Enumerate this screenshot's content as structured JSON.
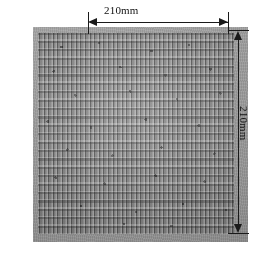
{
  "figure": {
    "kind": "micrograph",
    "background_color": "#ffffff",
    "photo": {
      "base_color": "#9b9b9b",
      "block_color": "#878787",
      "wall_highlight_color": "#e6e6e6",
      "channel_shadow_color": "#2a2a2a"
    }
  },
  "annotations": {
    "line_color": "#1a1a1a",
    "width_dimension": {
      "label": "210mm",
      "orientation": "horizontal",
      "arrow_style": "double-headed"
    },
    "height_dimension": {
      "label": "210mm",
      "orientation": "vertical",
      "arrow_style": "double-headed"
    }
  }
}
